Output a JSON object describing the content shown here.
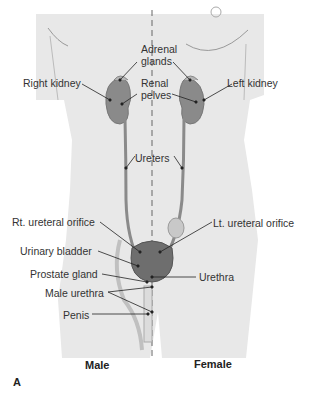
{
  "figure": {
    "panel_label": "A",
    "captions": {
      "male": "Male",
      "female": "Female"
    },
    "labels": {
      "adrenal_glands_1": "Adrenal",
      "adrenal_glands_2": "glands",
      "right_kidney": "Right kidney",
      "left_kidney": "Left kidney",
      "renal_pelves_1": "Renal",
      "renal_pelves_2": "pelves",
      "ureters": "Ureters",
      "rt_ureteral_orifice": "Rt. ureteral orifice",
      "lt_ureteral_orifice": "Lt. ureteral orifice",
      "urinary_bladder": "Urinary bladder",
      "prostate_gland": "Prostate gland",
      "urethra": "Urethra",
      "male_urethra": "Male urethra",
      "penis": "Penis"
    },
    "colors": {
      "body": "#e8e8e8",
      "organ": "#8a8a8a",
      "organ_dark": "#6e6e6e",
      "line": "#222222"
    }
  }
}
